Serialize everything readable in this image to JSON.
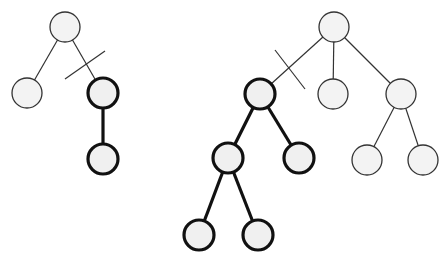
{
  "diagram": {
    "colors": {
      "background": "#ffffff",
      "node_fill": "#f2f2f2",
      "thin_stroke": "#333333",
      "bold_stroke": "#111111"
    },
    "node_radius": 15,
    "trees": [
      {
        "id": "left-tree",
        "nodes": [
          {
            "id": "L0",
            "x": 65,
            "y": 27,
            "bold": false
          },
          {
            "id": "L1",
            "x": 27,
            "y": 93,
            "bold": false
          },
          {
            "id": "L2",
            "x": 103,
            "y": 93,
            "bold": true
          },
          {
            "id": "L3",
            "x": 103,
            "y": 159,
            "bold": true
          }
        ],
        "edges": [
          {
            "from": "L0",
            "to": "L1",
            "bold": false,
            "cut": false
          },
          {
            "from": "L0",
            "to": "L2",
            "bold": false,
            "cut": true
          },
          {
            "from": "L2",
            "to": "L3",
            "bold": true,
            "cut": false
          }
        ],
        "cut_marks": [
          {
            "x1": 65,
            "y1": 79,
            "x2": 105,
            "y2": 51
          }
        ]
      },
      {
        "id": "right-tree",
        "nodes": [
          {
            "id": "R0",
            "x": 334,
            "y": 27,
            "bold": false
          },
          {
            "id": "R1",
            "x": 260,
            "y": 94,
            "bold": true
          },
          {
            "id": "R2",
            "x": 333,
            "y": 94,
            "bold": false
          },
          {
            "id": "R3",
            "x": 401,
            "y": 94,
            "bold": false
          },
          {
            "id": "R4",
            "x": 228,
            "y": 158,
            "bold": true
          },
          {
            "id": "R5",
            "x": 299,
            "y": 158,
            "bold": true
          },
          {
            "id": "R6",
            "x": 367,
            "y": 160,
            "bold": false
          },
          {
            "id": "R7",
            "x": 423,
            "y": 160,
            "bold": false
          },
          {
            "id": "R8",
            "x": 199,
            "y": 235,
            "bold": true
          },
          {
            "id": "R9",
            "x": 258,
            "y": 235,
            "bold": true
          }
        ],
        "edges": [
          {
            "from": "R0",
            "to": "R1",
            "bold": false,
            "cut": true
          },
          {
            "from": "R0",
            "to": "R2",
            "bold": false,
            "cut": false
          },
          {
            "from": "R0",
            "to": "R3",
            "bold": false,
            "cut": false
          },
          {
            "from": "R1",
            "to": "R4",
            "bold": true,
            "cut": false
          },
          {
            "from": "R1",
            "to": "R5",
            "bold": true,
            "cut": false
          },
          {
            "from": "R3",
            "to": "R6",
            "bold": false,
            "cut": false
          },
          {
            "from": "R3",
            "to": "R7",
            "bold": false,
            "cut": false
          },
          {
            "from": "R4",
            "to": "R8",
            "bold": true,
            "cut": false
          },
          {
            "from": "R4",
            "to": "R9",
            "bold": true,
            "cut": false
          }
        ],
        "cut_marks": [
          {
            "x1": 275,
            "y1": 50,
            "x2": 305,
            "y2": 89
          }
        ]
      }
    ]
  }
}
